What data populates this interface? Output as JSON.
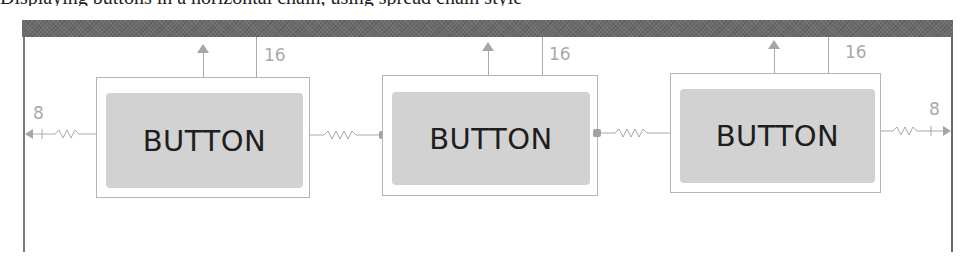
{
  "caption_clipped": "Displaying buttons in a horizontal chain, using spread chain style",
  "canvas": {
    "header_color": "#6b6b6b",
    "frame_color": "#7a7a7a",
    "constraint_color": "#a9a9a9",
    "button_fill": "#d2d2d2"
  },
  "buttons": [
    {
      "label": "BUTTON",
      "top_margin": "16"
    },
    {
      "label": "BUTTON",
      "top_margin": "16"
    },
    {
      "label": "BUTTON",
      "top_margin": "16"
    }
  ],
  "constraints": {
    "left_margin": "8",
    "right_margin": "8"
  }
}
